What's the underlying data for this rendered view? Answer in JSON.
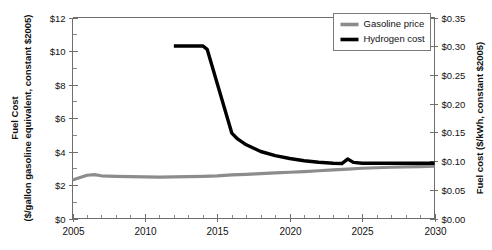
{
  "chart_data": {
    "type": "line",
    "title": "",
    "xlabel": "",
    "ylabel": "Fuel Cost\n($/gallon gasoline equivalent, constant $2005)",
    "y2label": "Fuel cost ($/kWh, constant $2005)",
    "grid": false,
    "legend_position": "top-right",
    "xlim": [
      2005,
      2030
    ],
    "ylim": [
      0,
      12
    ],
    "y2lim": [
      0.0,
      0.35
    ],
    "x_ticks": [
      2005,
      2010,
      2015,
      2020,
      2025,
      2030
    ],
    "x_tick_labels": [
      "2005",
      "2010",
      "2015",
      "2020",
      "2025",
      "2030"
    ],
    "x_minor_step": 1,
    "y_ticks": [
      0,
      2,
      4,
      6,
      8,
      10,
      12
    ],
    "y_tick_labels": [
      "$0",
      "$2",
      "$4",
      "$6",
      "$8",
      "$10",
      "$12"
    ],
    "y_minor_step": 1,
    "y2_ticks": [
      0.0,
      0.05,
      0.1,
      0.15,
      0.2,
      0.25,
      0.3,
      0.35
    ],
    "y2_tick_labels": [
      "$0.00",
      "$0.05",
      "$0.10",
      "$0.15",
      "$0.20",
      "$0.25",
      "$0.30",
      "$0.35"
    ],
    "series": [
      {
        "name": "Gasoline price",
        "color": "#8c8c8c",
        "width": 3.2,
        "x": [
          2005,
          2006,
          2006.5,
          2007,
          2008,
          2009,
          2010,
          2011,
          2012,
          2013,
          2014,
          2015,
          2016,
          2017,
          2018,
          2019,
          2020,
          2021,
          2022,
          2023,
          2024,
          2025,
          2026,
          2027,
          2028,
          2029,
          2030
        ],
        "values": [
          2.3,
          2.58,
          2.62,
          2.55,
          2.52,
          2.5,
          2.48,
          2.47,
          2.48,
          2.5,
          2.52,
          2.55,
          2.6,
          2.64,
          2.68,
          2.72,
          2.76,
          2.8,
          2.85,
          2.9,
          2.95,
          3.0,
          3.03,
          3.06,
          3.08,
          3.1,
          3.12
        ]
      },
      {
        "name": "Hydrogen cost",
        "color": "#000000",
        "width": 3.4,
        "x": [
          2012,
          2014,
          2014.3,
          2016,
          2016.4,
          2017,
          2018,
          2019,
          2020,
          2021,
          2022,
          2023,
          2023.6,
          2024,
          2024.4,
          2025,
          2026,
          2027,
          2028,
          2029,
          2030
        ],
        "values": [
          10.3,
          10.3,
          10.1,
          5.1,
          4.75,
          4.4,
          4.0,
          3.75,
          3.58,
          3.45,
          3.36,
          3.3,
          3.28,
          3.55,
          3.35,
          3.3,
          3.3,
          3.3,
          3.3,
          3.3,
          3.3
        ]
      }
    ],
    "legend": [
      {
        "label": "Gasoline price",
        "color": "#8c8c8c"
      },
      {
        "label": "Hydrogen cost",
        "color": "#000000"
      }
    ]
  },
  "axis_titles": {
    "left_line1": "Fuel Cost",
    "left_line2": "($/gallon gasoline equivalent, constant $2005)",
    "right": "Fuel cost ($/kWh, constant $2005)"
  }
}
